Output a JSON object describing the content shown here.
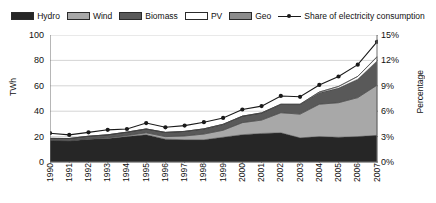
{
  "chart_data": {
    "type": "area",
    "title": "",
    "subtitle": "",
    "xlabel": "",
    "ylabel": "TWh",
    "y2label": "Percentage",
    "grid": true,
    "legend_position": "top",
    "categories": [
      "1990",
      "1991",
      "1992",
      "1993",
      "1994",
      "1995",
      "1996",
      "1997",
      "1998",
      "1999",
      "2000",
      "2001",
      "2002",
      "2003",
      "2004",
      "2005",
      "2006",
      "2007"
    ],
    "ylim": [
      0,
      100
    ],
    "yticks": [
      0,
      20,
      40,
      60,
      80,
      100
    ],
    "ytick_labels": [
      "0",
      "20",
      "40",
      "60",
      "80",
      "100"
    ],
    "y2lim": [
      0,
      15
    ],
    "y2ticks": [
      0,
      3,
      6,
      9,
      12,
      15
    ],
    "y2tick_labels": [
      "0%",
      "3%",
      "6%",
      "9%",
      "12%",
      "15%"
    ],
    "stacked": true,
    "series": [
      {
        "name": "Hydro",
        "color": "#262626",
        "values": [
          17.0,
          16.5,
          18.0,
          18.5,
          20.0,
          21.5,
          18.0,
          17.5,
          17.5,
          19.5,
          21.5,
          22.5,
          23.0,
          19.0,
          20.0,
          19.5,
          20.0,
          21.0
        ]
      },
      {
        "name": "Wind",
        "color": "#a8a8a8",
        "values": [
          0.1,
          0.2,
          0.3,
          0.6,
          0.9,
          1.5,
          2.0,
          3.0,
          4.5,
          5.5,
          9.5,
          10.5,
          15.8,
          18.7,
          25.5,
          27.2,
          30.7,
          39.5
        ]
      },
      {
        "name": "Biomass",
        "color": "#595959",
        "values": [
          1.5,
          1.8,
          2.0,
          2.3,
          2.6,
          3.0,
          3.3,
          3.6,
          4.0,
          4.6,
          5.0,
          5.5,
          6.5,
          7.5,
          9.0,
          11.5,
          14.5,
          19.0
        ]
      },
      {
        "name": "PV",
        "color": "#ffffff",
        "values": [
          0.0,
          0.0,
          0.0,
          0.0,
          0.0,
          0.0,
          0.0,
          0.0,
          0.1,
          0.1,
          0.1,
          0.2,
          0.2,
          0.3,
          0.6,
          1.3,
          2.2,
          3.1
        ]
      },
      {
        "name": "Geo",
        "color": "#8c8c8c",
        "values": [
          0.0,
          0.0,
          0.0,
          0.0,
          0.0,
          0.0,
          0.0,
          0.0,
          0.0,
          0.0,
          0.0,
          0.0,
          0.0,
          0.0,
          0.0,
          0.0,
          0.0,
          0.4
        ]
      }
    ],
    "line_series": {
      "name": "Share of electricity consumption",
      "color": "#1a1a1a",
      "axis": "right",
      "unit": "%",
      "values": [
        3.4,
        3.2,
        3.5,
        3.8,
        3.9,
        4.6,
        4.1,
        4.3,
        4.7,
        5.2,
        6.2,
        6.6,
        7.8,
        7.7,
        9.1,
        10.1,
        11.5,
        14.2
      ]
    }
  },
  "legend": {
    "items": [
      {
        "label": "Hydro",
        "type": "swatch",
        "color": "#262626",
        "icon": "legend-swatch-icon"
      },
      {
        "label": "Wind",
        "type": "swatch",
        "color": "#a8a8a8",
        "icon": "legend-swatch-icon"
      },
      {
        "label": "Biomass",
        "type": "swatch",
        "color": "#595959",
        "icon": "legend-swatch-icon"
      },
      {
        "label": "PV",
        "type": "swatch",
        "color": "#ffffff",
        "icon": "legend-swatch-icon"
      },
      {
        "label": "Geo",
        "type": "swatch",
        "color": "#8c8c8c",
        "icon": "legend-swatch-icon"
      },
      {
        "label": "Share of electricity consumption",
        "type": "line",
        "color": "#1a1a1a",
        "icon": "legend-line-marker-icon"
      }
    ]
  }
}
